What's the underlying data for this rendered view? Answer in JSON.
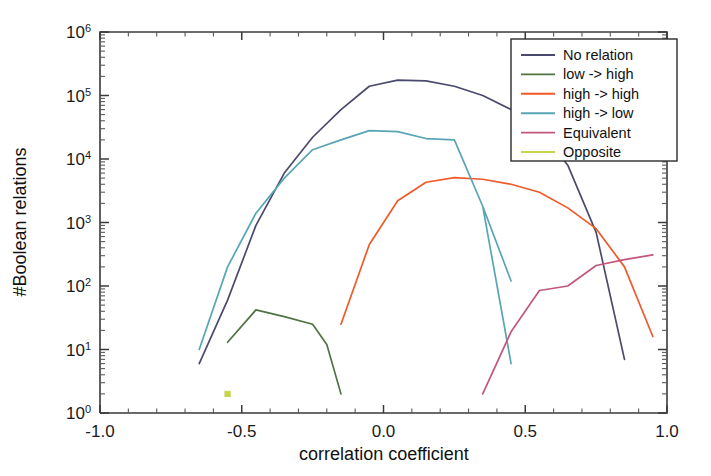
{
  "chart_data": {
    "type": "line",
    "title": "",
    "xlabel": "correlation coefficient",
    "ylabel": "#Boolean relations",
    "xlim": [
      -1.0,
      1.0
    ],
    "ylim": [
      1,
      1000000
    ],
    "yscale": "log",
    "grid": false,
    "legend_position": "top-right",
    "xticks": [
      "-1.0",
      "-0.5",
      "0.0",
      "0.5",
      "1.0"
    ],
    "xtick_values": [
      -1.0,
      -0.5,
      0.0,
      0.5,
      1.0
    ],
    "ytick_labels": [
      "10^0",
      "10^1",
      "10^2",
      "10^3",
      "10^4",
      "10^5",
      "10^6"
    ],
    "ytick_mantissa": "10",
    "ytick_exponents": [
      "0",
      "1",
      "2",
      "3",
      "4",
      "5",
      "6"
    ],
    "ytick_values": [
      1,
      10,
      100,
      1000,
      10000,
      100000,
      1000000
    ],
    "series": [
      {
        "name": "No relation",
        "color": "#4a4a6e",
        "points": [
          [
            -0.65,
            6
          ],
          [
            -0.55,
            60
          ],
          [
            -0.45,
            900
          ],
          [
            -0.35,
            6000
          ],
          [
            -0.25,
            22000
          ],
          [
            -0.15,
            60000
          ],
          [
            -0.05,
            140000
          ],
          [
            0.05,
            175000
          ],
          [
            0.15,
            170000
          ],
          [
            0.25,
            140000
          ],
          [
            0.35,
            100000
          ],
          [
            0.45,
            60000
          ],
          [
            0.55,
            30000
          ],
          [
            0.65,
            8000
          ],
          [
            0.75,
            700
          ],
          [
            0.85,
            7
          ]
        ]
      },
      {
        "name": "low -> high",
        "color": "#4f7342",
        "points": [
          [
            -0.55,
            13
          ],
          [
            -0.45,
            42
          ],
          [
            -0.35,
            33
          ],
          [
            -0.25,
            25
          ],
          [
            -0.2,
            12
          ],
          [
            -0.15,
            2
          ]
        ]
      },
      {
        "name": "high -> high",
        "color": "#f05a28",
        "points": [
          [
            -0.15,
            25
          ],
          [
            -0.05,
            450
          ],
          [
            0.05,
            2200
          ],
          [
            0.15,
            4300
          ],
          [
            0.25,
            5100
          ],
          [
            0.35,
            4800
          ],
          [
            0.45,
            4000
          ],
          [
            0.55,
            3000
          ],
          [
            0.65,
            1700
          ],
          [
            0.75,
            800
          ],
          [
            0.85,
            200
          ],
          [
            0.95,
            16
          ]
        ]
      },
      {
        "name": "high -> low",
        "color": "#58a5b5",
        "points": [
          [
            -0.65,
            10
          ],
          [
            -0.55,
            200
          ],
          [
            -0.45,
            1400
          ],
          [
            -0.35,
            5000
          ],
          [
            -0.25,
            14000
          ],
          [
            -0.15,
            20000
          ],
          [
            -0.05,
            28000
          ],
          [
            0.05,
            27000
          ],
          [
            0.15,
            21000
          ],
          [
            0.25,
            20000
          ],
          [
            0.35,
            1800
          ],
          [
            0.45,
            120
          ],
          [
            0.35,
            1800
          ],
          [
            0.45,
            6
          ]
        ]
      },
      {
        "name": "Equivalent",
        "color": "#c4577c",
        "points": [
          [
            0.35,
            2
          ],
          [
            0.45,
            19
          ],
          [
            0.55,
            85
          ],
          [
            0.65,
            100
          ],
          [
            0.75,
            210
          ],
          [
            0.85,
            260
          ],
          [
            0.95,
            310
          ]
        ]
      },
      {
        "name": "Opposite",
        "color": "#c7d44a",
        "points": [
          [
            -0.55,
            2
          ]
        ]
      }
    ]
  },
  "legend": {
    "entries": [
      {
        "label": "No relation",
        "color": "#4a4a6e"
      },
      {
        "label": "low -> high",
        "color": "#4f7342"
      },
      {
        "label": "high -> high",
        "color": "#f05a28"
      },
      {
        "label": "high -> low",
        "color": "#58a5b5"
      },
      {
        "label": "Equivalent",
        "color": "#c4577c"
      },
      {
        "label": "Opposite",
        "color": "#c7d44a"
      }
    ]
  }
}
